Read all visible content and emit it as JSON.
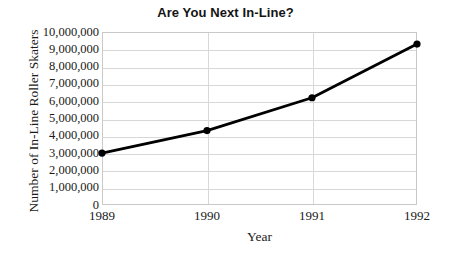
{
  "chart_data": {
    "type": "line",
    "title": "Are You Next In-Line?",
    "xlabel": "Year",
    "ylabel": "Number of In-Line Roller Skaters",
    "categories": [
      "1989",
      "1990",
      "1991",
      "1992"
    ],
    "x": [
      1989,
      1990,
      1991,
      1992
    ],
    "values": [
      3000000,
      4300000,
      6200000,
      9300000
    ],
    "series": [
      {
        "name": "Number of In-Line Roller Skaters",
        "values": [
          3000000,
          4300000,
          6200000,
          9300000
        ]
      }
    ],
    "ylim": [
      0,
      10000000
    ],
    "ytick_values": [
      0,
      1000000,
      2000000,
      3000000,
      4000000,
      5000000,
      6000000,
      7000000,
      8000000,
      9000000,
      10000000
    ],
    "ytick_labels": [
      "0",
      "1,000,000",
      "2,000,000",
      "3,000,000",
      "4,000,000",
      "5,000,000",
      "6,000,000",
      "7,000,000",
      "8,000,000",
      "9,000,000",
      "10,000,000"
    ],
    "xtick_labels": [
      "1989",
      "1990",
      "1991",
      "1992"
    ],
    "grid": "both",
    "legend": "none",
    "marker": "filled-circle",
    "line_color": "#000000",
    "grid_color": "#d8d8d8",
    "axis_color": "#c9c9c9",
    "background_color": "#ffffff"
  }
}
